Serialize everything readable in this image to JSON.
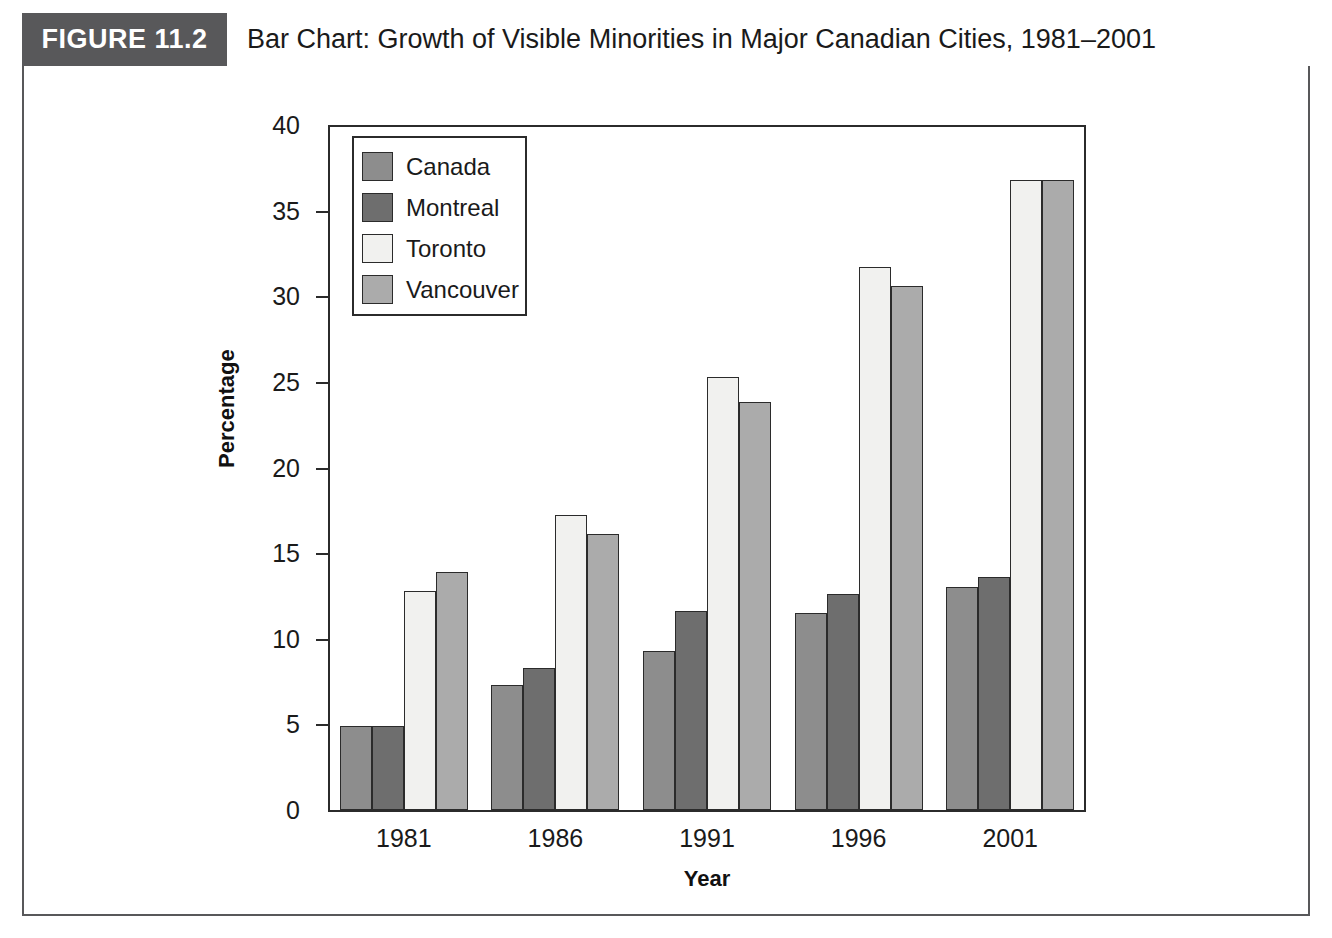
{
  "figure": {
    "badge": "FIGURE 11.2",
    "title": "Bar Chart: Growth of Visible Minorities in Major Canadian Cities, 1981–2001"
  },
  "chart_data": {
    "type": "bar",
    "title": "Bar Chart: Growth of Visible Minorities in Major Canadian Cities, 1981–2001",
    "xlabel": "Year",
    "ylabel": "Percentage",
    "categories": [
      "1981",
      "1986",
      "1991",
      "1996",
      "2001"
    ],
    "ylim": [
      0,
      40
    ],
    "yticks": [
      0,
      5,
      10,
      15,
      20,
      25,
      30,
      35,
      40
    ],
    "grid": false,
    "legend_position": "upper-left-inside",
    "series": [
      {
        "name": "Canada",
        "color": "#8d8d8d",
        "values": [
          4.9,
          7.3,
          9.3,
          11.5,
          13.0
        ]
      },
      {
        "name": "Montreal",
        "color": "#6e6e6e",
        "values": [
          4.9,
          8.3,
          11.6,
          12.6,
          13.6
        ]
      },
      {
        "name": "Toronto",
        "color": "#f1f1ef",
        "values": [
          12.8,
          17.2,
          25.3,
          31.7,
          36.8
        ]
      },
      {
        "name": "Vancouver",
        "color": "#ababab",
        "values": [
          13.9,
          16.1,
          23.8,
          30.6,
          36.8
        ]
      }
    ]
  },
  "colors": {
    "badge_background": "#58585a",
    "frame_border": "#58585a",
    "axis": "#2b2b2b",
    "page_background": "#ffffff"
  }
}
